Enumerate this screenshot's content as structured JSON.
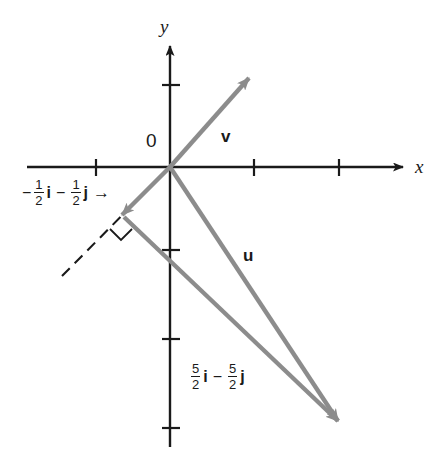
{
  "figure": {
    "axes": {
      "x_label": "x",
      "y_label": "y",
      "origin_label": "0",
      "x_ticks": [
        -1,
        1,
        2
      ],
      "y_ticks": [
        1,
        -1,
        -2,
        -3
      ],
      "x_range": [
        -2.2,
        3.3
      ],
      "y_range": [
        -3.6,
        1.7
      ]
    },
    "vector_v": {
      "label": "v",
      "from": [
        0,
        0
      ],
      "to": [
        1.1,
        1.35
      ],
      "color": "#8c8c8c"
    },
    "vector_u": {
      "label": "u",
      "from": [
        0,
        0
      ],
      "to": [
        2.45,
        -3.1
      ],
      "color": "#8c8c8c"
    },
    "vector_projection_long": {
      "label": "",
      "from": [
        -0.5,
        -0.5
      ],
      "to": [
        2.45,
        -3.1
      ],
      "color": "#8c8c8c"
    },
    "vector_projection": {
      "label": "-1/2 i - 1/2 j",
      "from": [
        0,
        0
      ],
      "to": [
        -0.5,
        -0.5
      ],
      "color": "#8c8c8c"
    },
    "dashed_line": {
      "from": [
        -1.3,
        -1.35
      ],
      "to": [
        0.05,
        0.05
      ],
      "style": "dashed",
      "color": "#1a1a1a"
    },
    "right_angle_marker": {
      "at": [
        -0.52,
        -0.55
      ],
      "size": 14
    },
    "label_projection": {
      "sign": "−",
      "num1": "1",
      "den1": "2",
      "unit1": "i",
      "op": "−",
      "num2": "1",
      "den2": "2",
      "unit2": "j",
      "pointer": "→"
    },
    "label_u_components": {
      "num1": "5",
      "den1": "2",
      "unit1": "i",
      "op": "−",
      "num2": "5",
      "den2": "2",
      "unit2": "j"
    },
    "colors": {
      "vector": "#8c8c8c",
      "axis": "#1a1a1a",
      "text": "#1a1a1a",
      "background": "#ffffff"
    }
  }
}
